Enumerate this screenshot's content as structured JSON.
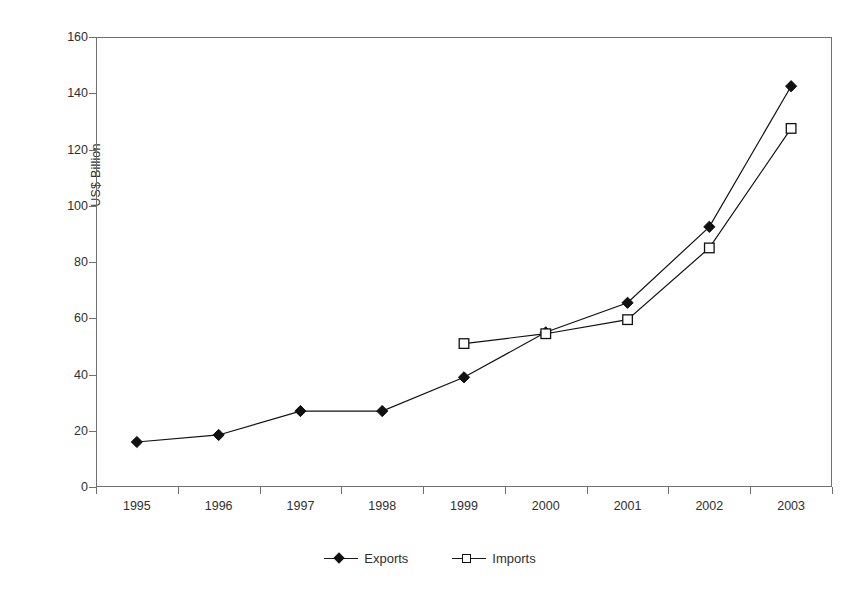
{
  "chart_data": {
    "type": "line",
    "title": "",
    "subtitle": "",
    "xlabel": "",
    "ylabel": "US$ Billion",
    "categories": [
      "1995",
      "1996",
      "1997",
      "1998",
      "1999",
      "2000",
      "2001",
      "2002",
      "2003"
    ],
    "ylim": [
      0,
      160
    ],
    "yticks": [
      0,
      20,
      40,
      60,
      80,
      100,
      120,
      140,
      160
    ],
    "ytick_labels": [
      "0",
      "20",
      "40",
      "60",
      "80",
      "100",
      "120",
      "140",
      "160"
    ],
    "grid": false,
    "legend_position": "bottom",
    "series": [
      {
        "name": "Exports",
        "marker": "filled-diamond",
        "color": "#111111",
        "values": [
          16,
          18.5,
          27,
          27,
          39,
          55,
          65.5,
          92.5,
          142.5
        ]
      },
      {
        "name": "Imports",
        "marker": "open-square",
        "color": "#111111",
        "values": [
          null,
          null,
          null,
          null,
          51,
          54.5,
          59.5,
          85,
          127.5
        ]
      }
    ],
    "annotations": []
  },
  "legend": {
    "items": [
      {
        "label": "Exports",
        "marker": "filled-diamond"
      },
      {
        "label": "Imports",
        "marker": "open-square"
      }
    ]
  }
}
